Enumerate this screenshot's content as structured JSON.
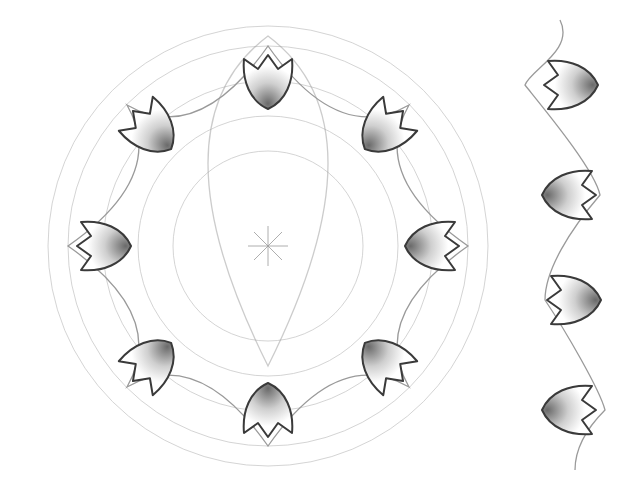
{
  "artwork": {
    "title": "Pencil sketch of tulip rosette and border",
    "center": {
      "x": 268,
      "y": 246
    },
    "rosette": {
      "tulip_count": 8,
      "tulip_radius": 185,
      "guide_circle_radii": [
        95,
        130,
        165,
        200,
        220
      ],
      "colors": {
        "line": "#3a3a3a",
        "guide": "#c9c9c9",
        "arc": "#9a9a9a",
        "shade": "#8a8a8a"
      }
    },
    "border": {
      "x": 570,
      "tulips": [
        {
          "y": 85,
          "direction": "right"
        },
        {
          "y": 195,
          "direction": "left"
        },
        {
          "y": 300,
          "direction": "right"
        },
        {
          "y": 410,
          "direction": "left"
        }
      ]
    }
  }
}
